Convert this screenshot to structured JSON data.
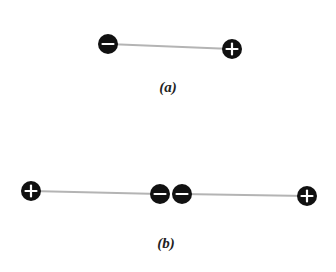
{
  "diagram": {
    "background": "#ffffff",
    "line_color": "#b4b4b4",
    "charge_fill": "#111111",
    "sign_color": "#ffffff",
    "panels": [
      {
        "label": "(a)",
        "label_pos": [
          168,
          87
        ],
        "charges": [
          {
            "sign": "-",
            "cx": 108,
            "cy": 44,
            "r": 10
          },
          {
            "sign": "+",
            "cx": 232,
            "cy": 49,
            "r": 10
          }
        ],
        "bonds": [
          [
            0,
            1
          ]
        ]
      },
      {
        "label": "(b)",
        "label_pos": [
          166,
          243
        ],
        "charges": [
          {
            "sign": "+",
            "cx": 31,
            "cy": 191,
            "r": 10
          },
          {
            "sign": "-",
            "cx": 160,
            "cy": 194,
            "r": 10
          },
          {
            "sign": "-",
            "cx": 182,
            "cy": 194,
            "r": 10
          },
          {
            "sign": "+",
            "cx": 307,
            "cy": 196,
            "r": 10
          }
        ],
        "bonds": [
          [
            0,
            1
          ],
          [
            2,
            3
          ]
        ]
      }
    ]
  }
}
